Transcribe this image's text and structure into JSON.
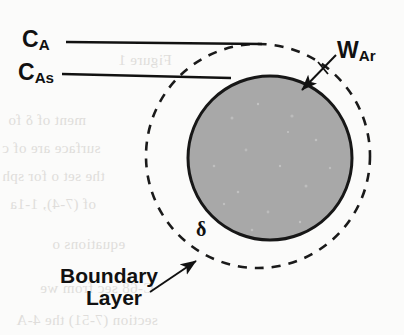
{
  "figure": {
    "kind": "boundary-layer-sphere-diagram",
    "background_color": "#fbfbfa"
  },
  "labels": {
    "bulk_concentration": {
      "symbol": "C",
      "subscript": "A",
      "text": "CA"
    },
    "surface_concentration": {
      "symbol": "C",
      "subscript": "As",
      "text": "CAs"
    },
    "mass_flux": {
      "symbol": "W",
      "subscript": "Ar",
      "text": "WAr"
    },
    "film_thickness": {
      "text": "δ"
    },
    "boundary_layer": {
      "line1": "Boundary",
      "line2": "Layer"
    }
  },
  "geometry": {
    "sphere": {
      "cx": 270,
      "cy": 158,
      "r": 82,
      "fill": "#a8a8a8",
      "stroke": "#171717",
      "stroke_width": 3
    },
    "boundary_circle": {
      "cx": 258,
      "cy": 156,
      "r": 112,
      "stroke": "#1a1a1a",
      "stroke_width": 2.6,
      "dash": "9 8"
    },
    "line_ca": {
      "x1": 66,
      "y1": 42,
      "x2": 262,
      "y2": 44
    },
    "line_cas": {
      "x1": 62,
      "y1": 74,
      "x2": 231,
      "y2": 78
    },
    "arrow_war": {
      "x1": 336,
      "y1": 55,
      "x2": 300,
      "y2": 92
    },
    "arrow_boundary": {
      "x1": 150,
      "y1": 292,
      "x2": 194,
      "y2": 262
    }
  },
  "colors": {
    "ink": "#111111",
    "sphere_fill": "#a8a8a8",
    "paper": "#fbfbfa",
    "bleed_text": "#c9c6c2"
  },
  "bleed_through_text": [
    "Figure 1",
    "ment of δ fo",
    "surface are of c",
    "the set o for sph",
    "of (7-4), 1-1a",
    "equations o",
    "C-68 sec from we",
    "section (7-51) the 4-A"
  ]
}
